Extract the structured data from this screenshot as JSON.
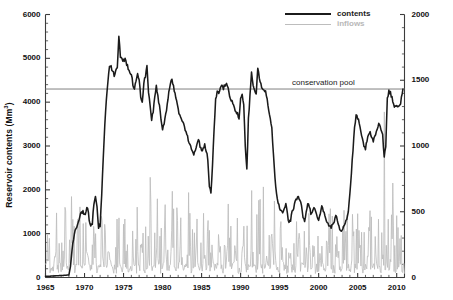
{
  "chart_data": {
    "type": "line",
    "title": "",
    "xlabel": "",
    "ylabel": "Reservoir contents (Mm3)",
    "ylabel_right": "Reservoir monthly inflow (Mm3)",
    "xlim": [
      1965,
      2011
    ],
    "ylim": [
      0,
      6000
    ],
    "ylim_right": [
      0,
      2000
    ],
    "xticks": [
      1965,
      1970,
      1975,
      1980,
      1985,
      1990,
      1995,
      2000,
      2005,
      2010
    ],
    "xticklabels": [
      "1965",
      "1970",
      "1975",
      "1980",
      "1985",
      "1990",
      "1995",
      "2000",
      "2005",
      "2010"
    ],
    "xminor_step": 1,
    "yticks": [
      0,
      1000,
      2000,
      3000,
      4000,
      5000,
      6000
    ],
    "yticklabels": [
      "0",
      "1000",
      "2000",
      "3000",
      "4000",
      "5000",
      "6000"
    ],
    "yminor_step": 200,
    "yticks_right": [
      0,
      500,
      1000,
      1500,
      2000
    ],
    "yticklabels_right": [
      "0",
      "500",
      "1000",
      "1500",
      "2000"
    ],
    "yminor_step_right": 100,
    "grid": false,
    "legend_position": "top-right",
    "legend": [
      {
        "name": "contents",
        "color": "#1b1b1b",
        "width": 2.1
      },
      {
        "name": "inflows",
        "color": "#bdbdbd",
        "width": 1.0
      }
    ],
    "annotations": [
      {
        "name": "conservation pool",
        "text": "conservation pool",
        "type": "hline",
        "axis": "left",
        "value": 4300,
        "color": "#808080",
        "label_x": 2001.5
      }
    ],
    "series": [
      {
        "name": "contents",
        "axis": "left",
        "color": "#1b1b1b",
        "units": "Mm3",
        "x": [
          1965.0,
          1965.5,
          1966.0,
          1966.5,
          1967.0,
          1967.5,
          1968.0,
          1968.2,
          1968.4,
          1968.6,
          1968.8,
          1969.0,
          1969.2,
          1969.4,
          1969.6,
          1969.8,
          1970.0,
          1970.2,
          1970.4,
          1970.6,
          1970.8,
          1971.0,
          1971.2,
          1971.4,
          1971.6,
          1971.8,
          1972.0,
          1972.2,
          1972.4,
          1972.6,
          1972.8,
          1973.0,
          1973.2,
          1973.4,
          1973.6,
          1973.8,
          1974.0,
          1974.2,
          1974.4,
          1974.6,
          1974.8,
          1975.0,
          1975.2,
          1975.4,
          1975.6,
          1975.8,
          1976.0,
          1976.2,
          1976.4,
          1976.6,
          1976.8,
          1977.0,
          1977.2,
          1977.4,
          1977.6,
          1977.8,
          1978.0,
          1978.2,
          1978.4,
          1978.6,
          1978.8,
          1979.0,
          1979.2,
          1979.4,
          1979.6,
          1979.8,
          1980.0,
          1980.2,
          1980.4,
          1980.6,
          1980.8,
          1981.0,
          1981.2,
          1981.4,
          1981.6,
          1981.8,
          1982.0,
          1982.2,
          1982.4,
          1982.6,
          1982.8,
          1983.0,
          1983.2,
          1983.4,
          1983.6,
          1983.8,
          1984.0,
          1984.2,
          1984.4,
          1984.6,
          1984.8,
          1985.0,
          1985.2,
          1985.4,
          1985.6,
          1985.8,
          1986.0,
          1986.2,
          1986.4,
          1986.6,
          1986.8,
          1987.0,
          1987.2,
          1987.4,
          1987.6,
          1987.8,
          1988.0,
          1988.2,
          1988.4,
          1988.6,
          1988.8,
          1989.0,
          1989.2,
          1989.4,
          1989.6,
          1989.8,
          1990.0,
          1990.2,
          1990.4,
          1990.6,
          1990.8,
          1991.0,
          1991.2,
          1991.4,
          1991.6,
          1991.8,
          1992.0,
          1992.2,
          1992.4,
          1992.6,
          1992.8,
          1993.0,
          1993.2,
          1993.4,
          1993.6,
          1993.8,
          1994.0,
          1994.2,
          1994.4,
          1994.6,
          1994.8,
          1995.0,
          1995.2,
          1995.4,
          1995.6,
          1995.8,
          1996.0,
          1996.2,
          1996.4,
          1996.6,
          1996.8,
          1997.0,
          1997.2,
          1997.4,
          1997.6,
          1997.8,
          1998.0,
          1998.2,
          1998.4,
          1998.6,
          1998.8,
          1999.0,
          1999.2,
          1999.4,
          1999.6,
          1999.8,
          2000.0,
          2000.2,
          2000.4,
          2000.6,
          2000.8,
          2001.0,
          2001.2,
          2001.4,
          2001.6,
          2001.8,
          2002.0,
          2002.2,
          2002.4,
          2002.6,
          2002.8,
          2003.0,
          2003.2,
          2003.4,
          2003.6,
          2003.8,
          2004.0,
          2004.2,
          2004.4,
          2004.6,
          2004.8,
          2005.0,
          2005.2,
          2005.4,
          2005.6,
          2005.8,
          2006.0,
          2006.2,
          2006.4,
          2006.6,
          2006.8,
          2007.0,
          2007.2,
          2007.4,
          2007.6,
          2007.8,
          2008.0,
          2008.2,
          2008.4,
          2008.6,
          2008.8,
          2009.0,
          2009.2,
          2009.4,
          2009.6,
          2009.8,
          2010.0,
          2010.2,
          2010.4,
          2010.6,
          2010.8
        ],
        "values": [
          30,
          30,
          35,
          40,
          45,
          50,
          60,
          250,
          600,
          900,
          1050,
          1150,
          1250,
          1380,
          1480,
          1520,
          1420,
          1500,
          1620,
          1300,
          1180,
          1250,
          1700,
          1820,
          1600,
          1150,
          1200,
          1900,
          2700,
          3500,
          4100,
          4500,
          4780,
          4830,
          4700,
          4620,
          4700,
          4820,
          5480,
          5050,
          4980,
          4950,
          4990,
          4850,
          4780,
          4700,
          4650,
          4400,
          4320,
          4500,
          4650,
          4550,
          4150,
          3980,
          4420,
          4600,
          4800,
          4200,
          3950,
          3600,
          3800,
          4150,
          4350,
          4150,
          3900,
          3600,
          3350,
          3500,
          3700,
          3950,
          4250,
          4400,
          4550,
          4350,
          4200,
          4000,
          3850,
          3700,
          3600,
          3580,
          3450,
          3300,
          3200,
          3100,
          3000,
          2900,
          2820,
          2900,
          3050,
          3180,
          3000,
          2880,
          2950,
          3050,
          2900,
          2700,
          2100,
          1900,
          2600,
          3400,
          4050,
          4250,
          4200,
          4320,
          4380,
          4300,
          4400,
          4440,
          4300,
          4150,
          4050,
          3950,
          3850,
          3800,
          3750,
          3600,
          4100,
          4200,
          3950,
          3000,
          2450,
          3600,
          4150,
          4700,
          4350,
          4250,
          4200,
          4800,
          4500,
          4400,
          4300,
          4250,
          4300,
          4050,
          3850,
          3600,
          3400,
          2800,
          2300,
          1900,
          1700,
          1560,
          1500,
          1480,
          1600,
          1700,
          1450,
          1250,
          1300,
          1500,
          1600,
          1750,
          1800,
          1820,
          1780,
          1620,
          1380,
          1250,
          1500,
          1700,
          1620,
          1450,
          1500,
          1620,
          1550,
          1400,
          1300,
          1480,
          1600,
          1520,
          1400,
          1280,
          1230,
          1180,
          1150,
          1200,
          1280,
          1380,
          1320,
          1180,
          1080,
          1100,
          1180,
          1250,
          1350,
          1500,
          1900,
          2400,
          2900,
          3400,
          3700,
          3650,
          3500,
          3300,
          3150,
          3000,
          2950,
          3100,
          3250,
          3300,
          3200,
          3100,
          3200,
          3350,
          3450,
          3520,
          3400,
          3250,
          2750,
          3000,
          4100,
          4250,
          4200,
          4100,
          3950,
          3900,
          3950,
          3880,
          3900,
          4100,
          4300
        ],
        "marker": "none"
      },
      {
        "name": "inflows",
        "axis": "right",
        "color": "#bdbdbd",
        "units": "Mm3",
        "sampling": "monthly",
        "baseline": 120,
        "typical_range": [
          60,
          300
        ],
        "spike_range": [
          400,
          800
        ],
        "notable_peaks": [
          {
            "x": 1966.4,
            "value": 780
          },
          {
            "x": 1967.1,
            "value": 420
          },
          {
            "x": 1969.3,
            "value": 310
          },
          {
            "x": 1971.4,
            "value": 530
          },
          {
            "x": 1973.3,
            "value": 250
          },
          {
            "x": 1974.4,
            "value": 720
          },
          {
            "x": 1975.5,
            "value": 250
          },
          {
            "x": 1976.3,
            "value": 280
          },
          {
            "x": 1977.4,
            "value": 300
          },
          {
            "x": 1978.4,
            "value": 1210
          },
          {
            "x": 1979.2,
            "value": 550
          },
          {
            "x": 1980.4,
            "value": 330
          },
          {
            "x": 1981.4,
            "value": 830
          },
          {
            "x": 1982.3,
            "value": 420
          },
          {
            "x": 1983.3,
            "value": 300
          },
          {
            "x": 1984.4,
            "value": 290
          },
          {
            "x": 1985.4,
            "value": 270
          },
          {
            "x": 1986.3,
            "value": 560
          },
          {
            "x": 1987.3,
            "value": 490
          },
          {
            "x": 1988.3,
            "value": 590
          },
          {
            "x": 1989.3,
            "value": 400
          },
          {
            "x": 1990.4,
            "value": 620
          },
          {
            "x": 1991.4,
            "value": 1050
          },
          {
            "x": 1992.1,
            "value": 530
          },
          {
            "x": 1993.3,
            "value": 380
          },
          {
            "x": 1994.4,
            "value": 300
          },
          {
            "x": 1995.3,
            "value": 330
          },
          {
            "x": 1996.4,
            "value": 250
          },
          {
            "x": 1997.3,
            "value": 420
          },
          {
            "x": 1998.4,
            "value": 360
          },
          {
            "x": 1999.3,
            "value": 440
          },
          {
            "x": 2000.4,
            "value": 380
          },
          {
            "x": 2001.3,
            "value": 340
          },
          {
            "x": 2002.4,
            "value": 290
          },
          {
            "x": 2003.3,
            "value": 320
          },
          {
            "x": 2004.4,
            "value": 500
          },
          {
            "x": 2005.3,
            "value": 420
          },
          {
            "x": 2006.4,
            "value": 300
          },
          {
            "x": 2007.3,
            "value": 450
          },
          {
            "x": 2008.4,
            "value": 2000
          },
          {
            "x": 2009.3,
            "value": 330
          },
          {
            "x": 2010.4,
            "value": 470
          }
        ],
        "marker": "none"
      }
    ]
  }
}
